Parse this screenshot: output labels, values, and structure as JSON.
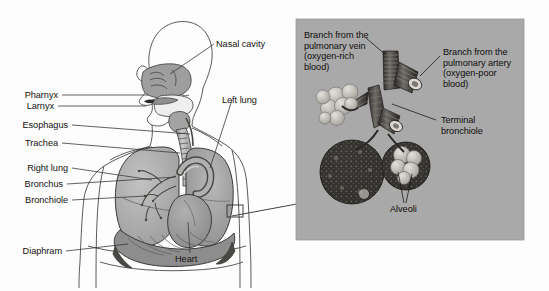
{
  "figure": {
    "background_color": "#fdfdfd",
    "width": 549,
    "height": 291
  },
  "panels": {
    "left": {
      "name": "torso-respiratory-overview",
      "description": "Side/front view of human head and torso showing the respiratory tract",
      "background_color": "#fdfdfd"
    },
    "right": {
      "name": "alveoli-detail-inset",
      "description": "Magnified detail of terminal bronchiole and alveoli",
      "background_color": "#a9a9a9",
      "border_color": "#8f8f8f"
    }
  },
  "colors": {
    "lung_fill": "#a8a8a8",
    "lung_fill_light": "#bdbdbd",
    "heart_fill": "#9a9a9a",
    "trachea_fill": "#b4b4b4",
    "diaphragm_fill": "#8d8d8d",
    "airway_fill": "#9c9c9c",
    "outline": "#2b2b2b",
    "leader_line": "#3a3a3a",
    "inset_bg": "#a9a9a9",
    "alveoli_dark": "#3c3a38",
    "alveoli_light": "#cfcdc9",
    "text": "#15110f"
  },
  "left_panel_labels": [
    {
      "id": "nasal-cavity",
      "text": "Nasal cavity",
      "side": "right"
    },
    {
      "id": "pharynx",
      "text": "Pharnyx",
      "side": "left"
    },
    {
      "id": "larynx",
      "text": "Larnyx",
      "side": "left"
    },
    {
      "id": "esophagus",
      "text": "Esophagus",
      "side": "left"
    },
    {
      "id": "trachea",
      "text": "Trachea",
      "side": "left"
    },
    {
      "id": "right-lung",
      "text": "Right lung",
      "side": "left"
    },
    {
      "id": "bronchus",
      "text": "Bronchus",
      "side": "left"
    },
    {
      "id": "bronchiole",
      "text": "Bronchiole",
      "side": "left"
    },
    {
      "id": "diaphragm",
      "text": "Diaphram",
      "side": "left"
    },
    {
      "id": "left-lung",
      "text": "Left lung",
      "side": "right"
    },
    {
      "id": "heart",
      "text": "Heart",
      "side": "bottom"
    }
  ],
  "right_panel_labels": [
    {
      "id": "pulmonary-vein",
      "text": "Branch from the pulmonary vein (oxygen-rich blood)"
    },
    {
      "id": "pulmonary-artery",
      "text": "Branch from the pulmonary artery (oxygen-poor blood)"
    },
    {
      "id": "terminal-bronchiole",
      "text": "Terminal bronchiole"
    },
    {
      "id": "alveoli",
      "text": "Alveoli"
    }
  ],
  "callout": {
    "name": "magnification-callout",
    "description": "Small rectangle on the left lung linked by an arrow to the magnified inset"
  }
}
